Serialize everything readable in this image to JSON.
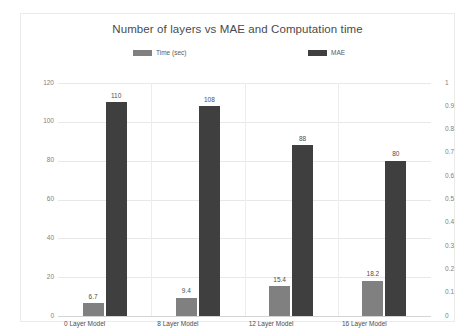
{
  "chart_data": {
    "type": "bar",
    "title": "Number of layers vs MAE and Computation time",
    "xlabel": "",
    "ylabel": "",
    "categories": [
      "0 Layer  Model",
      "8 Layer Model",
      "12 Layer Model",
      "16 Layer Model"
    ],
    "series": [
      {
        "name": "Time (sec)",
        "axis": "left",
        "color": "#808080",
        "values": [
          6.7,
          9.4,
          15.4,
          18.2
        ],
        "labels": [
          "6.7",
          "9.4",
          "15.4",
          "18.2"
        ]
      },
      {
        "name": "MAE",
        "axis": "right",
        "color": "#3f3f3f",
        "values": [
          110,
          108,
          88,
          80
        ],
        "labels": [
          "110",
          "108",
          "88",
          "80"
        ]
      }
    ],
    "left_axis": {
      "ticks": [
        0,
        20,
        40,
        60,
        80,
        100,
        120
      ],
      "tick_labels": [
        "0",
        "20",
        "40",
        "60",
        "80",
        "100",
        "120"
      ],
      "ylim": [
        0,
        120
      ]
    },
    "right_axis": {
      "ticks": [
        0,
        0.1,
        0.2,
        0.3,
        0.4,
        0.5,
        0.6,
        0.7,
        0.8,
        0.9,
        1
      ],
      "tick_labels": [
        "0",
        "0.1",
        "0.2",
        "0.3",
        "0.4",
        "0.5",
        "0.6",
        "0.7",
        "0.8",
        "0.9",
        "1"
      ],
      "ylim": [
        0,
        1
      ]
    },
    "mae_plot_max": 120,
    "grid": true,
    "legend_position": "top"
  },
  "legend": {
    "time_label": "Time (sec)",
    "mae_label": "MAE"
  },
  "colors": {
    "time_bar": "#808080",
    "mae_bar": "#3f3f3f",
    "grid": "#e8e8e8",
    "text": "#4d4d4d",
    "axis_text": "#808080"
  }
}
